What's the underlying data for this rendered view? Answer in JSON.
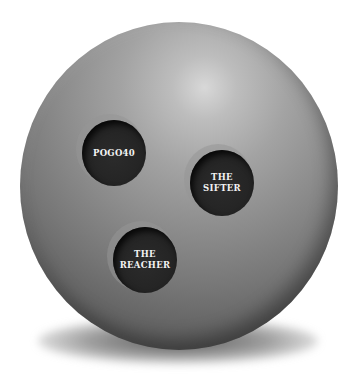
{
  "image": {
    "subject": "bowling ball",
    "background_color": "#ffffff",
    "ball_color": "#8d8d8d",
    "hole_color": "#232323",
    "label_color": "#f2f2f2"
  },
  "finger_holes": [
    {
      "id": "pogo40",
      "label": "POGO40"
    },
    {
      "id": "the-sifter",
      "label": "THE\nSIFTER"
    },
    {
      "id": "the-reacher",
      "label": "THE\nREACHER"
    }
  ]
}
